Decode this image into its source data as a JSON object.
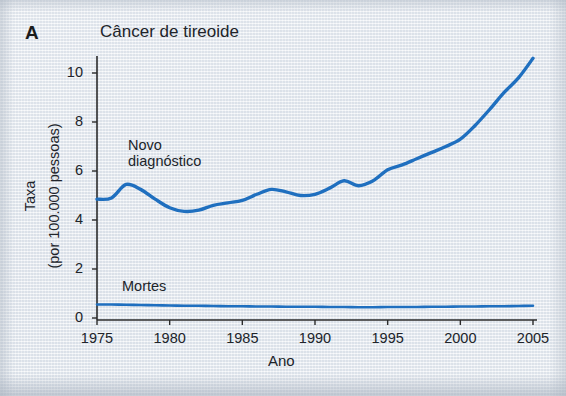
{
  "figure": {
    "panel_label": "A",
    "title": "Câncer de tireoide",
    "xlabel": "Ano",
    "ylabel_line1": "Taxa",
    "ylabel_line2": "(por 100.000 pessoas)",
    "line_color": "#1f6fbf",
    "axis_color": "#2b2b2b",
    "background_color": "#e9edf2"
  },
  "annotations": {
    "new_diagnosis_line1": "Novo",
    "new_diagnosis_line2": "diagnóstico",
    "deaths": "Mortes"
  },
  "chart_data": {
    "type": "line",
    "title": "Câncer de tireoide",
    "xlabel": "Ano",
    "ylabel": "Taxa (por 100.000 pessoas)",
    "xlim": [
      1975,
      2005
    ],
    "ylim": [
      0,
      11
    ],
    "grid": false,
    "legend": "inline-annotations",
    "xticks": [
      1975,
      1980,
      1985,
      1990,
      1995,
      2000,
      2005
    ],
    "yticks": [
      0,
      2,
      4,
      6,
      8,
      10
    ],
    "x": [
      1975,
      1976,
      1977,
      1978,
      1979,
      1980,
      1981,
      1982,
      1983,
      1984,
      1985,
      1986,
      1987,
      1988,
      1989,
      1990,
      1991,
      1992,
      1993,
      1994,
      1995,
      1996,
      1997,
      1998,
      1999,
      2000,
      2001,
      2002,
      2003,
      2004,
      2005
    ],
    "series": [
      {
        "name": "Novo diagnóstico",
        "color": "#1f6fbf",
        "values": [
          4.85,
          4.9,
          5.45,
          5.25,
          4.85,
          4.5,
          4.35,
          4.4,
          4.6,
          4.7,
          4.8,
          5.05,
          5.25,
          5.15,
          5.0,
          5.05,
          5.3,
          5.6,
          5.4,
          5.6,
          6.05,
          6.25,
          6.5,
          6.75,
          7.0,
          7.3,
          7.85,
          8.5,
          9.2,
          9.8,
          10.6
        ]
      },
      {
        "name": "Mortes",
        "color": "#1f6fbf",
        "values": [
          0.55,
          0.55,
          0.54,
          0.53,
          0.52,
          0.51,
          0.5,
          0.5,
          0.49,
          0.48,
          0.48,
          0.47,
          0.47,
          0.46,
          0.46,
          0.46,
          0.45,
          0.45,
          0.44,
          0.44,
          0.45,
          0.45,
          0.45,
          0.46,
          0.46,
          0.47,
          0.47,
          0.48,
          0.48,
          0.49,
          0.5
        ]
      }
    ]
  }
}
